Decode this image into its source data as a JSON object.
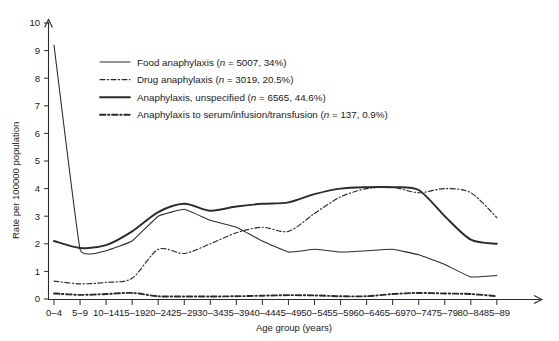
{
  "figure": {
    "title": "",
    "y_axis_label": "Rate per 100000 population",
    "x_axis_label": "Age group (years)"
  },
  "legend": {
    "items": [
      {
        "label": "Food anaphylaxis (n = 5007, 34%)",
        "style": "solid-thin"
      },
      {
        "label": "Drug anaphylaxis (n = 3019, 20.5%)",
        "style": "dashdot-thin"
      },
      {
        "label": "Anaphylaxis, unspecified (n = 6565, 44.6%)",
        "style": "solid-thick"
      },
      {
        "label": "Anaphylaxis to serum/infusion/transfusion (n = 137, 0.9%)",
        "style": "dashdot-thick"
      }
    ]
  },
  "chart_data": {
    "type": "line",
    "title": "",
    "xlabel": "Age group (years)",
    "ylabel": "Rate per 100000 population",
    "ylim": [
      0,
      10
    ],
    "yticks": [
      0,
      1,
      2,
      3,
      4,
      5,
      6,
      7,
      8,
      9,
      10
    ],
    "grid": false,
    "legend_position": "upper-left-inside",
    "categories": [
      "0–4",
      "5–9",
      "10–14",
      "15–19",
      "20–24",
      "25–29",
      "30–34",
      "35–39",
      "40–44",
      "45–49",
      "50–54",
      "55–59",
      "60–64",
      "65–69",
      "70–74",
      "75–79",
      "80–84",
      "85–89"
    ],
    "series": [
      {
        "name": "Food anaphylaxis",
        "n": 5007,
        "percent": "34%",
        "style": "solid-thin",
        "values": [
          9.2,
          1.8,
          1.75,
          2.1,
          3.0,
          3.25,
          2.85,
          2.6,
          2.1,
          1.7,
          1.8,
          1.7,
          1.75,
          1.8,
          1.6,
          1.25,
          0.8,
          0.85
        ]
      },
      {
        "name": "Drug anaphylaxis",
        "n": 3019,
        "percent": "20.5%",
        "style": "dashdot-thin",
        "values": [
          0.65,
          0.55,
          0.6,
          0.75,
          1.8,
          1.65,
          2.0,
          2.4,
          2.6,
          2.45,
          3.1,
          3.7,
          4.0,
          4.05,
          3.85,
          4.0,
          3.85,
          2.95
        ]
      },
      {
        "name": "Anaphylaxis, unspecified",
        "n": 6565,
        "percent": "44.6%",
        "style": "solid-thick",
        "values": [
          2.1,
          1.85,
          1.95,
          2.45,
          3.15,
          3.45,
          3.2,
          3.35,
          3.45,
          3.5,
          3.8,
          4.0,
          4.05,
          4.05,
          3.95,
          3.0,
          2.15,
          2.0
        ]
      },
      {
        "name": "Anaphylaxis to serum/infusion/transfusion",
        "n": 137,
        "percent": "0.9%",
        "style": "dashdot-thick",
        "values": [
          0.2,
          0.15,
          0.18,
          0.22,
          0.1,
          0.09,
          0.09,
          0.1,
          0.12,
          0.14,
          0.13,
          0.1,
          0.1,
          0.18,
          0.22,
          0.2,
          0.18,
          0.1
        ]
      }
    ]
  }
}
